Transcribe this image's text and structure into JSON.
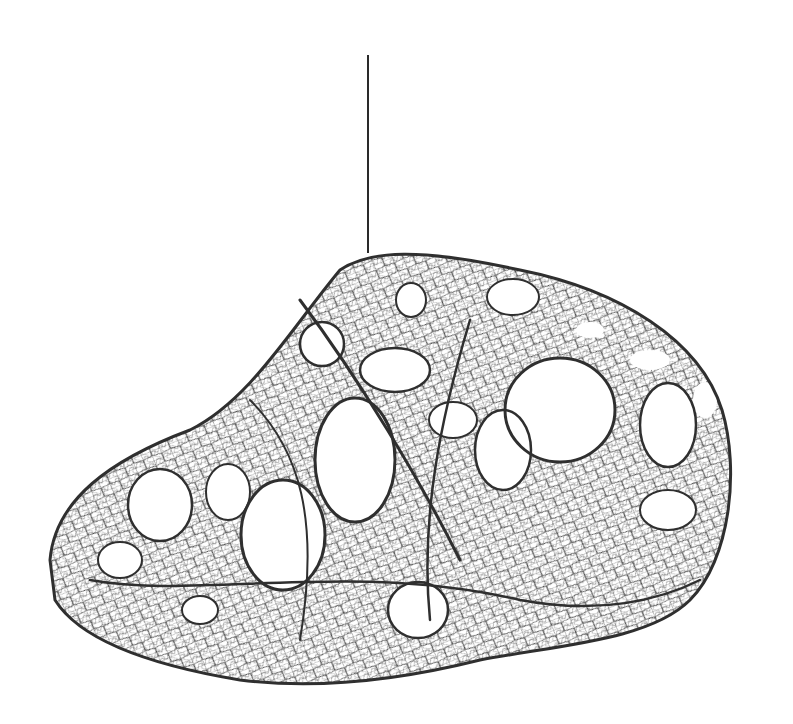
{
  "image": {
    "description": "Hanging pendant sculpture made of a tangled grey wire/fiber mesh with large irregular openings, suspended by a single thin black cord against a plain white background",
    "background_color": "#ffffff",
    "mesh_color": "#3a3a3a",
    "cord_color": "#2a2a2a"
  }
}
